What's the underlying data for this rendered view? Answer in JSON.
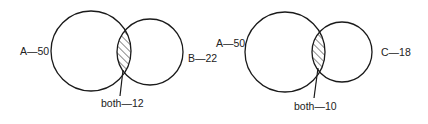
{
  "diagrams": [
    {
      "name": "venn-a-b",
      "sets": [
        {
          "label": "A—50",
          "set": "A",
          "count": 50
        },
        {
          "label": "B—22",
          "set": "B",
          "count": 22
        }
      ],
      "intersection": {
        "label": "both—12",
        "count": 12
      }
    },
    {
      "name": "venn-a-c",
      "sets": [
        {
          "label": "A—50",
          "set": "A",
          "count": 50
        },
        {
          "label": "C—18",
          "set": "C",
          "count": 18
        }
      ],
      "intersection": {
        "label": "both—10",
        "count": 10
      }
    }
  ],
  "colors": {
    "stroke": "#1a1a1a",
    "background": "#ffffff"
  }
}
